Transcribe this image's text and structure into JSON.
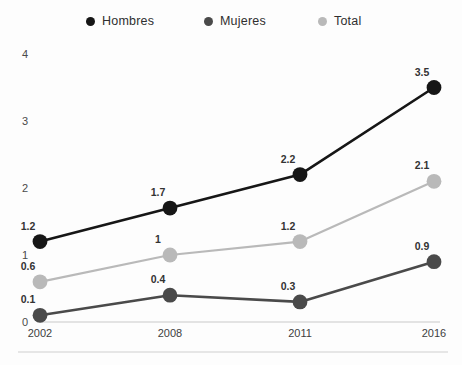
{
  "chart_data": {
    "type": "line",
    "title": "",
    "xlabel": "",
    "ylabel": "",
    "categories": [
      "2002",
      "2008",
      "2011",
      "2016"
    ],
    "ylim": [
      0,
      4
    ],
    "yticks": [
      "0",
      "1",
      "2",
      "3",
      "4"
    ],
    "grid": false,
    "legend_position": "top",
    "series": [
      {
        "name": "Hombres",
        "color": "#161616",
        "values": [
          1.2,
          1.7,
          2.2,
          3.5
        ],
        "labels": [
          "1.2",
          "1.7",
          "2.2",
          "3.5"
        ]
      },
      {
        "name": "Mujeres",
        "color": "#4a4a4a",
        "values": [
          0.1,
          0.4,
          0.3,
          0.9
        ],
        "labels": [
          "0.1",
          "0.4",
          "0.3",
          "0.9"
        ]
      },
      {
        "name": "Total",
        "color": "#b9b9b9",
        "values": [
          0.6,
          1.0,
          1.2,
          2.1
        ],
        "labels": [
          "0.6",
          "1",
          "1.2",
          "2.1"
        ]
      }
    ]
  },
  "legend": {
    "items": [
      {
        "label": "Hombres",
        "color": "#161616",
        "x": 86
      },
      {
        "label": "Mujeres",
        "color": "#4a4a4a",
        "x": 204
      },
      {
        "label": "Total",
        "color": "#b9b9b9",
        "x": 318
      }
    ]
  },
  "axes": {
    "y_tick_labels": [
      "4",
      "3",
      "2",
      "1",
      "0"
    ],
    "x_tick_labels": [
      "2002",
      "2008",
      "2011",
      "2016"
    ]
  }
}
